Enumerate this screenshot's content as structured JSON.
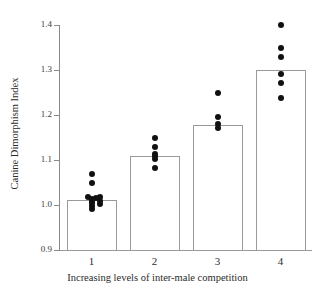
{
  "chart_data": {
    "type": "bar",
    "title": "",
    "xlabel": "Increasing levels of inter-male competition",
    "ylabel": "Canine Dimorphism Index",
    "categories": [
      "1",
      "2",
      "3",
      "4"
    ],
    "values": [
      1.012,
      1.11,
      1.178,
      1.3
    ],
    "ylim": [
      0.9,
      1.4
    ],
    "yticks": [
      "0.9",
      "1.0",
      "1.1",
      "1.2",
      "1.3",
      "1.4"
    ],
    "ytick_values": [
      0.9,
      1.0,
      1.1,
      1.2,
      1.3,
      1.4
    ],
    "grid": false,
    "legend": "none",
    "bar_fill": "#ffffff",
    "bar_edge": "#9a9a9a",
    "point_color": "#111111",
    "overlay_points": [
      {
        "category": "1",
        "values": [
          1.068,
          1.05,
          1.018,
          1.016,
          1.013,
          1.01,
          1.004,
          0.998,
          0.992,
          1.018,
          1.01,
          1.003
        ]
      },
      {
        "category": "2",
        "values": [
          1.148,
          1.128,
          1.113,
          1.108,
          1.103,
          1.082
        ]
      },
      {
        "category": "3",
        "values": [
          1.248,
          1.196,
          1.18,
          1.172
        ]
      },
      {
        "category": "4",
        "values": [
          1.4,
          1.348,
          1.33,
          1.292,
          1.272,
          1.238
        ]
      }
    ],
    "point_offsets": [
      [
        0,
        0,
        -4,
        4,
        0,
        0,
        0,
        0,
        0,
        8,
        8,
        8
      ],
      [
        0,
        0,
        0,
        0,
        0,
        0
      ],
      [
        0,
        0,
        0,
        0
      ],
      [
        0,
        0,
        0,
        0,
        0,
        0
      ]
    ]
  }
}
